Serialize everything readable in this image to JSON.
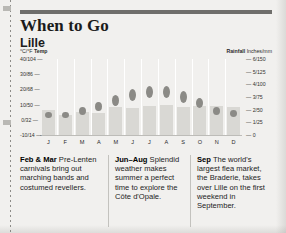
{
  "header": {
    "title": "When to Go",
    "subtitle": "Lille"
  },
  "chart_data": {
    "type": "bar",
    "categories": [
      "J",
      "F",
      "M",
      "A",
      "M",
      "J",
      "J",
      "A",
      "S",
      "O",
      "N",
      "D"
    ],
    "temp_axis": {
      "label": "°C/°F Temp",
      "label_bold": "Temp",
      "label_light": "°C/°F",
      "ticks": [
        "40/104",
        "30/86",
        "20/68",
        "10/50",
        "0/32",
        "-10/14"
      ],
      "tick_values": [
        40,
        30,
        20,
        10,
        0,
        -10
      ],
      "ylim": [
        -10,
        40
      ]
    },
    "rain_axis": {
      "label": "Rainfall Inches/mm",
      "label_bold": "Rainfall",
      "label_light": "Inches/mm",
      "ticks": [
        "6/150",
        "5/125",
        "4/100",
        "3/75",
        "2/50",
        "1/25",
        "0"
      ],
      "tick_values": [
        6,
        5,
        4,
        3,
        2,
        1,
        0
      ],
      "ylim": [
        0,
        6
      ]
    },
    "series": [
      {
        "name": "Rainfall",
        "unit": "inches",
        "render": "bar",
        "values": [
          2.0,
          1.6,
          1.8,
          1.7,
          2.2,
          2.1,
          2.3,
          2.4,
          2.2,
          2.3,
          2.3,
          2.2
        ]
      },
      {
        "name": "Temperature",
        "unit": "°C",
        "render": "dot",
        "values": [
          3,
          3,
          6,
          9,
          13,
          16,
          18,
          18,
          15,
          11,
          6,
          4
        ]
      }
    ],
    "grid": false,
    "legend": "none"
  },
  "notes": [
    {
      "month": "Feb & Mar",
      "text": " Pre-Lenten carnivals bring out marching bands and costumed revellers."
    },
    {
      "month": "Jun–Aug",
      "text": " Splendid weather makes summer a perfect time to explore the Côte d'Opale."
    },
    {
      "month": "Sep",
      "text": " The world's largest flea market, the Braderie, takes over Lille on the first weekend in September."
    }
  ],
  "colors": {
    "bar": "#d9d8d4",
    "dot": "#8b8a86",
    "rule": "#6f6e6b",
    "page": "#f1f0ee",
    "text": "#232323"
  }
}
